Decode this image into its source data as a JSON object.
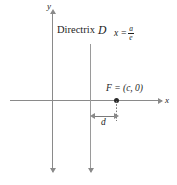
{
  "figure": {
    "background_color": "#ffffff",
    "line_color": "#8a8a8a",
    "text_color": "#1d1d1d"
  },
  "axes": {
    "y_label": "y",
    "x_label": "x",
    "origin": {
      "x": 52,
      "y": 100
    }
  },
  "directrix": {
    "word": "Directrix",
    "symbol": "D",
    "equation_lhs": "x =",
    "fraction_numerator": "a",
    "fraction_denominator": "e",
    "line_x": 90
  },
  "focus": {
    "label": "F = (c, 0)",
    "point_x": 116,
    "point_y": 100
  },
  "distance": {
    "label": "d",
    "from_x": 90,
    "to_x": 116
  }
}
